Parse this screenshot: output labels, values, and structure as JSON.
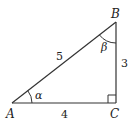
{
  "diagram": {
    "type": "right-triangle",
    "vertices": {
      "A": {
        "label": "A"
      },
      "B": {
        "label": "B"
      },
      "C": {
        "label": "C"
      }
    },
    "sides": {
      "hypotenuse_AB": "5",
      "side_AC": "4",
      "side_BC": "3"
    },
    "angles": {
      "at_A": "α",
      "at_B": "β",
      "at_C": "right-angle"
    },
    "colors": {
      "stroke": "#333333",
      "text": "#222222",
      "background": "#ffffff"
    }
  }
}
